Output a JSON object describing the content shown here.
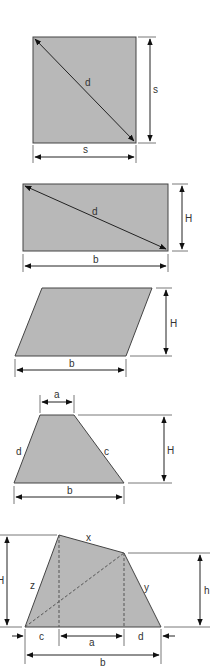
{
  "diagram": {
    "colors": {
      "fill": "#b8b8b8",
      "stroke": "#444444",
      "dimension": "#222222",
      "background": "#ffffff"
    },
    "figures": [
      {
        "id": "square",
        "shape": "square",
        "labels": {
          "diagonal": "d",
          "side_right": "s",
          "side_bottom": "s"
        }
      },
      {
        "id": "rectangle",
        "shape": "rectangle",
        "labels": {
          "diagonal": "d",
          "height": "H",
          "base": "b"
        }
      },
      {
        "id": "parallelogram",
        "shape": "parallelogram",
        "labels": {
          "height": "H",
          "base": "b"
        }
      },
      {
        "id": "trapezoid",
        "shape": "trapezoid",
        "labels": {
          "top": "a",
          "left": "d",
          "right": "c",
          "height": "H",
          "base": "b"
        }
      },
      {
        "id": "quadrilateral",
        "shape": "irregular quadrilateral",
        "labels": {
          "top": "x",
          "left": "z",
          "right": "y",
          "height_left": "H",
          "height_right": "h",
          "seg_c": "c",
          "seg_a": "a",
          "seg_d": "d",
          "base": "b"
        }
      }
    ]
  }
}
